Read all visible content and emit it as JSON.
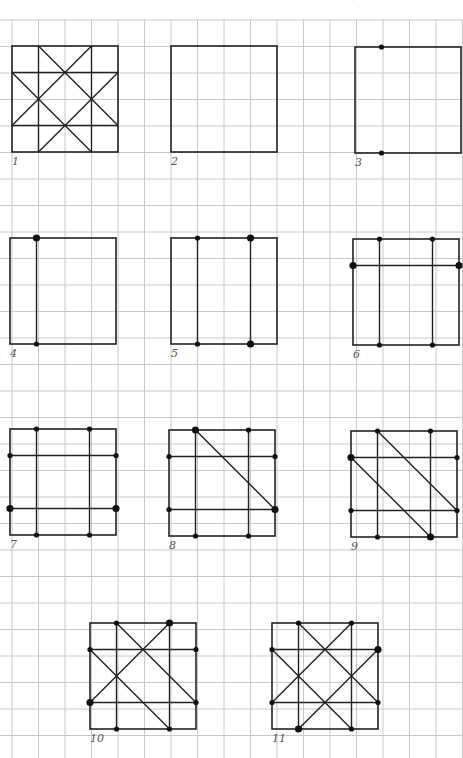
{
  "page": {
    "top_cropped_text": "· · · ·",
    "grid": {
      "origin_x": 12,
      "origin_y": 20,
      "cell": 26.5,
      "cols": 18,
      "rows": 28,
      "color": "#c8c8c8"
    },
    "figure_stroke": "#222222",
    "dot_color": "#111111"
  },
  "figures": [
    {
      "id": 1,
      "label": "1",
      "x": 12,
      "y": 46,
      "lines": [
        [
          0,
          1,
          4,
          1
        ],
        [
          0,
          3,
          4,
          3
        ],
        [
          1,
          0,
          1,
          4
        ],
        [
          3,
          0,
          3,
          4
        ],
        [
          1,
          0,
          4,
          3
        ],
        [
          3,
          0,
          0,
          3
        ],
        [
          0,
          1,
          3,
          4
        ],
        [
          4,
          1,
          1,
          4
        ]
      ],
      "dots": []
    },
    {
      "id": 2,
      "label": "2",
      "x": 171,
      "y": 46,
      "lines": [],
      "dots": []
    },
    {
      "id": 3,
      "label": "3",
      "x": 355,
      "y": 47,
      "lines": [],
      "dots": [
        [
          1,
          0,
          "s"
        ],
        [
          1,
          4,
          "s"
        ]
      ]
    },
    {
      "id": 4,
      "label": "4",
      "x": 10,
      "y": 238,
      "lines": [
        [
          1,
          0,
          1,
          4
        ]
      ],
      "dots": [
        [
          1,
          0,
          "l"
        ],
        [
          1,
          4,
          "s"
        ]
      ]
    },
    {
      "id": 5,
      "label": "5",
      "x": 171,
      "y": 238,
      "lines": [
        [
          1,
          0,
          1,
          4
        ],
        [
          3,
          0,
          3,
          4
        ]
      ],
      "dots": [
        [
          1,
          0,
          "s"
        ],
        [
          1,
          4,
          "s"
        ],
        [
          3,
          0,
          "l"
        ],
        [
          3,
          4,
          "l"
        ]
      ]
    },
    {
      "id": 6,
      "label": "6",
      "x": 353,
      "y": 239,
      "lines": [
        [
          1,
          0,
          1,
          4
        ],
        [
          3,
          0,
          3,
          4
        ],
        [
          0,
          1,
          4,
          1
        ]
      ],
      "dots": [
        [
          1,
          0,
          "s"
        ],
        [
          3,
          0,
          "s"
        ],
        [
          1,
          4,
          "s"
        ],
        [
          3,
          4,
          "s"
        ],
        [
          0,
          1,
          "l"
        ],
        [
          4,
          1,
          "l"
        ]
      ]
    },
    {
      "id": 7,
      "label": "7",
      "x": 10,
      "y": 429,
      "lines": [
        [
          1,
          0,
          1,
          4
        ],
        [
          3,
          0,
          3,
          4
        ],
        [
          0,
          1,
          4,
          1
        ],
        [
          0,
          3,
          4,
          3
        ]
      ],
      "dots": [
        [
          1,
          0,
          "s"
        ],
        [
          3,
          0,
          "s"
        ],
        [
          1,
          4,
          "s"
        ],
        [
          3,
          4,
          "s"
        ],
        [
          0,
          1,
          "s"
        ],
        [
          4,
          1,
          "s"
        ],
        [
          0,
          3,
          "l"
        ],
        [
          4,
          3,
          "l"
        ]
      ]
    },
    {
      "id": 8,
      "label": "8",
      "x": 169,
      "y": 430,
      "lines": [
        [
          1,
          0,
          1,
          4
        ],
        [
          3,
          0,
          3,
          4
        ],
        [
          0,
          1,
          4,
          1
        ],
        [
          0,
          3,
          4,
          3
        ],
        [
          1,
          0,
          4,
          3
        ]
      ],
      "dots": [
        [
          1,
          0,
          "l"
        ],
        [
          3,
          0,
          "s"
        ],
        [
          1,
          4,
          "s"
        ],
        [
          3,
          4,
          "s"
        ],
        [
          0,
          1,
          "s"
        ],
        [
          4,
          1,
          "s"
        ],
        [
          0,
          3,
          "s"
        ],
        [
          4,
          3,
          "l"
        ]
      ]
    },
    {
      "id": 9,
      "label": "9",
      "x": 351,
      "y": 431,
      "lines": [
        [
          1,
          0,
          1,
          4
        ],
        [
          3,
          0,
          3,
          4
        ],
        [
          0,
          1,
          4,
          1
        ],
        [
          0,
          3,
          4,
          3
        ],
        [
          1,
          0,
          4,
          3
        ],
        [
          0,
          1,
          3,
          4
        ]
      ],
      "dots": [
        [
          1,
          0,
          "s"
        ],
        [
          3,
          0,
          "s"
        ],
        [
          1,
          4,
          "s"
        ],
        [
          3,
          4,
          "l"
        ],
        [
          0,
          1,
          "l"
        ],
        [
          4,
          1,
          "s"
        ],
        [
          0,
          3,
          "s"
        ],
        [
          4,
          3,
          "s"
        ]
      ]
    },
    {
      "id": 10,
      "label": "10",
      "x": 90,
      "y": 623,
      "lines": [
        [
          1,
          0,
          1,
          4
        ],
        [
          3,
          0,
          3,
          4
        ],
        [
          0,
          1,
          4,
          1
        ],
        [
          0,
          3,
          4,
          3
        ],
        [
          1,
          0,
          4,
          3
        ],
        [
          0,
          1,
          3,
          4
        ],
        [
          3,
          0,
          0,
          3
        ]
      ],
      "dots": [
        [
          1,
          0,
          "s"
        ],
        [
          3,
          0,
          "l"
        ],
        [
          1,
          4,
          "s"
        ],
        [
          3,
          4,
          "s"
        ],
        [
          0,
          1,
          "s"
        ],
        [
          4,
          1,
          "s"
        ],
        [
          0,
          3,
          "l"
        ],
        [
          4,
          3,
          "s"
        ]
      ]
    },
    {
      "id": 11,
      "label": "11",
      "x": 272,
      "y": 623,
      "lines": [
        [
          1,
          0,
          1,
          4
        ],
        [
          3,
          0,
          3,
          4
        ],
        [
          0,
          1,
          4,
          1
        ],
        [
          0,
          3,
          4,
          3
        ],
        [
          1,
          0,
          4,
          3
        ],
        [
          0,
          1,
          3,
          4
        ],
        [
          3,
          0,
          0,
          3
        ],
        [
          4,
          1,
          1,
          4
        ]
      ],
      "dots": [
        [
          1,
          0,
          "s"
        ],
        [
          3,
          0,
          "s"
        ],
        [
          1,
          4,
          "l"
        ],
        [
          3,
          4,
          "s"
        ],
        [
          0,
          1,
          "s"
        ],
        [
          4,
          1,
          "l"
        ],
        [
          0,
          3,
          "s"
        ],
        [
          4,
          3,
          "s"
        ]
      ]
    }
  ]
}
